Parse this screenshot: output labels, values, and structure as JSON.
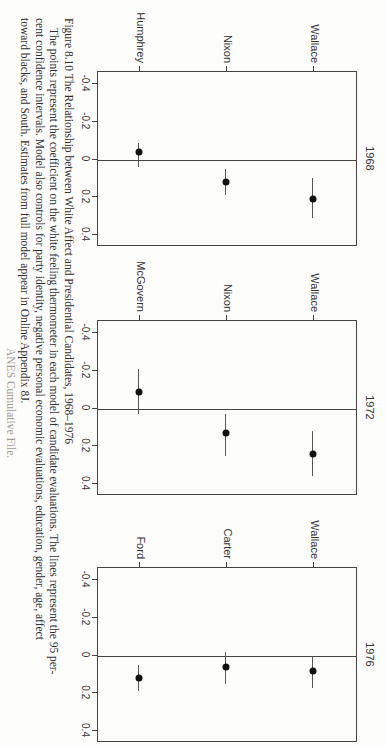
{
  "figure": {
    "label": "Figure 8.10",
    "title": "The Relationship between White Affect and Presidential Candidates, 1968–1976",
    "caption_lines": [
      "The points represent the coefficient on the white feeling thermometer in each model of candidate evaluations. The lines represent the 95 per-",
      "cent confidence intervals. Model also controls for party identity, negative personal economic evaluations, education, gender, age, affect",
      "toward blacks, and South. Estimates from full model appear in Online Appendix 8J."
    ],
    "partial_line": "ANES Cumulative File."
  },
  "axis": {
    "ticks": [
      "-0.4",
      "-0.2",
      "0",
      "0.2",
      "0.4"
    ]
  },
  "panels": [
    {
      "year": "1968",
      "candidates": [
        "Wallace",
        "Nixon",
        "Humphrey"
      ]
    },
    {
      "year": "1972",
      "candidates": [
        "Wallace",
        "Nixon",
        "McGovern"
      ]
    },
    {
      "year": "1976",
      "candidates": [
        "Wallace",
        "Carter",
        "Ford"
      ]
    }
  ],
  "chart_data": [
    {
      "type": "scatter",
      "title": "1968",
      "xlabel": "Coefficient on white feeling thermometer",
      "ylabel": "",
      "xlim": [
        -0.4,
        0.4
      ],
      "categories": [
        "Wallace",
        "Nixon",
        "Humphrey"
      ],
      "values": [
        0.21,
        0.12,
        -0.04
      ],
      "ci_low": [
        0.1,
        0.05,
        -0.09
      ],
      "ci_high": [
        0.31,
        0.19,
        0.04
      ],
      "reference_line": 0
    },
    {
      "type": "scatter",
      "title": "1972",
      "xlabel": "Coefficient on white feeling thermometer",
      "ylabel": "",
      "xlim": [
        -0.4,
        0.4
      ],
      "categories": [
        "Wallace",
        "Nixon",
        "McGovern"
      ],
      "values": [
        0.24,
        0.13,
        -0.09
      ],
      "ci_low": [
        0.12,
        0.03,
        -0.21
      ],
      "ci_high": [
        0.36,
        0.25,
        0.03
      ],
      "reference_line": 0
    },
    {
      "type": "scatter",
      "title": "1976",
      "xlabel": "Coefficient on white feeling thermometer",
      "ylabel": "",
      "xlim": [
        -0.4,
        0.4
      ],
      "categories": [
        "Wallace",
        "Carter",
        "Ford"
      ],
      "values": [
        0.08,
        0.06,
        0.12
      ],
      "ci_low": [
        0.0,
        -0.02,
        0.05
      ],
      "ci_high": [
        0.17,
        0.15,
        0.19
      ],
      "reference_line": 0
    }
  ]
}
